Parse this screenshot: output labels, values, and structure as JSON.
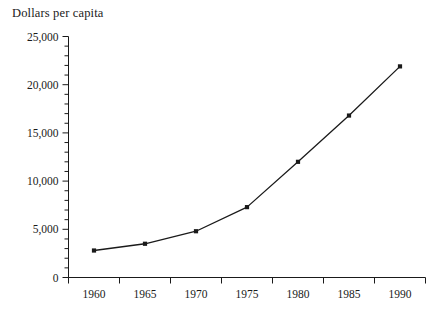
{
  "chart_data": {
    "type": "line",
    "title": "Dollars per capita",
    "xlabel": "",
    "ylabel": "Dollars per capita",
    "x": [
      1960,
      1965,
      1970,
      1975,
      1980,
      1985,
      1990
    ],
    "categories": [
      "1960",
      "1965",
      "1970",
      "1975",
      "1980",
      "1985",
      "1990"
    ],
    "values": [
      2800,
      3500,
      4800,
      7300,
      12000,
      16800,
      21900
    ],
    "series": [
      {
        "name": "Dollars per capita",
        "values": [
          2800,
          3500,
          4800,
          7300,
          12000,
          16800,
          21900
        ]
      }
    ],
    "xlim": [
      1957.5,
      1992.5
    ],
    "ylim": [
      0,
      25000
    ],
    "ytick_labels": [
      "0",
      "5,000",
      "10,000",
      "15,000",
      "20,000",
      "25,000"
    ],
    "ytick_values": [
      0,
      5000,
      10000,
      15000,
      20000,
      25000
    ],
    "yminor_step": 1000,
    "xtick_labels": [
      "1960",
      "1965",
      "1970",
      "1975",
      "1980",
      "1985",
      "1990"
    ],
    "grid": false,
    "legend": "none",
    "marker": "filled-square",
    "line_color": "#1a1a1a",
    "marker_color": "#1a1a1a",
    "background": "#ffffff"
  },
  "axes": {
    "title_text": "Dollars per capita"
  }
}
